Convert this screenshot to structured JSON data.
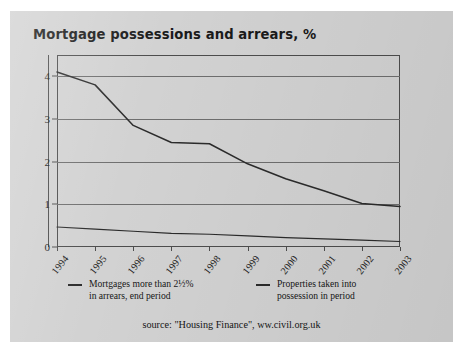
{
  "figure": {
    "title": "Mortgage possessions and arrears, %",
    "source": "source: \"Housing Finance\", ww.civil.org.uk",
    "panel_color": "#d2d2d2",
    "ink_color": "#2b2b2b"
  },
  "legend": {
    "items": [
      {
        "name": "arrears-series",
        "line1": "Mortgages more than 2½%",
        "line2": "in arrears, end period"
      },
      {
        "name": "possessions-series",
        "line1": "Properties taken into",
        "line2": "possession in period"
      }
    ]
  },
  "chart_data": {
    "type": "line",
    "title": "Mortgage possessions and arrears, %",
    "xlabel": "",
    "ylabel": "",
    "x": [
      "1994",
      "1995",
      "1996",
      "1997",
      "1998",
      "1999",
      "2000",
      "2001",
      "2002",
      "2003"
    ],
    "categories": [
      "1994",
      "1995",
      "1996",
      "1997",
      "1998",
      "1999",
      "2000",
      "2001",
      "2002",
      "2003"
    ],
    "ylim": [
      0,
      4.5
    ],
    "yticks": [
      0,
      1,
      2,
      3,
      4
    ],
    "ytick_labels": [
      "0",
      "1",
      "2",
      "3",
      "4"
    ],
    "grid": true,
    "gridlines_at": [
      1,
      2,
      3,
      4
    ],
    "legend_position": "below",
    "series": [
      {
        "name": "Mortgages more than 2½% in arrears, end period",
        "values": [
          4.1,
          3.8,
          2.85,
          2.45,
          2.42,
          1.95,
          1.6,
          1.32,
          1.02,
          0.95
        ]
      },
      {
        "name": "Properties taken into possession in period",
        "values": [
          0.47,
          0.42,
          0.37,
          0.32,
          0.3,
          0.26,
          0.22,
          0.19,
          0.16,
          0.13
        ]
      }
    ]
  }
}
